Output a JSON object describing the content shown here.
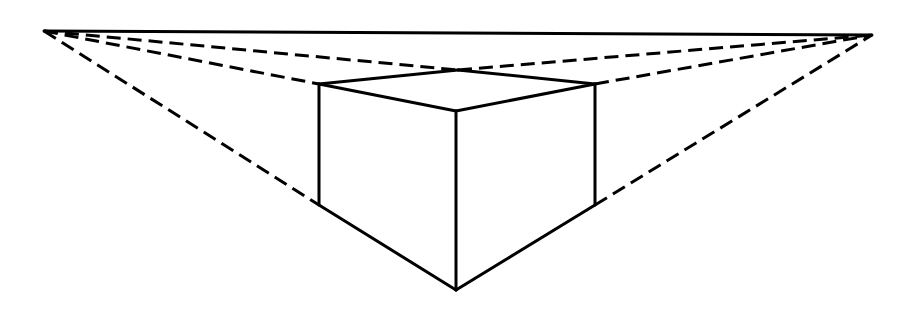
{
  "diagram": {
    "type": "two-point-perspective-box",
    "colors": {
      "stroke": "#000000",
      "background": "#ffffff"
    },
    "points": {
      "vp_left": [
        44,
        31
      ],
      "vp_right": [
        872,
        35
      ],
      "top_back": [
        458,
        70
      ],
      "top_left": [
        319,
        84
      ],
      "top_right": [
        595,
        84
      ],
      "top_front": [
        456,
        111
      ],
      "bottom_left": [
        319,
        205
      ],
      "bottom_right": [
        595,
        205
      ],
      "bottom_front": [
        456,
        290
      ]
    },
    "solid_edges": [
      [
        "vp_left",
        "vp_right"
      ],
      [
        "top_left",
        "top_back"
      ],
      [
        "top_back",
        "top_right"
      ],
      [
        "top_left",
        "top_front"
      ],
      [
        "top_front",
        "top_right"
      ],
      [
        "top_left",
        "bottom_left"
      ],
      [
        "top_right",
        "bottom_right"
      ],
      [
        "top_front",
        "bottom_front"
      ],
      [
        "bottom_left",
        "bottom_front"
      ],
      [
        "bottom_front",
        "bottom_right"
      ]
    ],
    "dashed_edges": [
      [
        "vp_left",
        "top_back"
      ],
      [
        "top_back",
        "vp_right"
      ],
      [
        "vp_left",
        "top_left"
      ],
      [
        "top_right",
        "vp_right"
      ],
      [
        "vp_left",
        "bottom_left"
      ],
      [
        "bottom_right",
        "vp_right"
      ]
    ]
  }
}
